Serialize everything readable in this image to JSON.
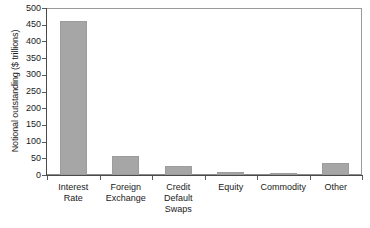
{
  "chart_data": {
    "type": "bar",
    "title": "",
    "subtitle": "",
    "xlabel": "",
    "ylabel": "Notional outstanding ($ trillions)",
    "categories": [
      "Interest Rate",
      "Foreign Exchange",
      "Credit Default Swaps",
      "Equity",
      "Commodity",
      "Other"
    ],
    "category_lines": [
      [
        "Interest",
        "Rate"
      ],
      [
        "Foreign",
        "Exchange"
      ],
      [
        "Credit",
        "Default",
        "Swaps"
      ],
      [
        "Equity"
      ],
      [
        "Commodity"
      ],
      [
        "Other"
      ]
    ],
    "values": [
      461,
      57,
      27,
      8,
      2,
      36
    ],
    "ylim": [
      0,
      500
    ],
    "y_ticks": [
      0,
      50,
      100,
      150,
      200,
      250,
      300,
      350,
      400,
      450,
      500
    ],
    "y_tick_labels": [
      "0",
      "50",
      "100",
      "150",
      "200",
      "250",
      "300",
      "350",
      "400",
      "450",
      "500"
    ],
    "grid": false,
    "legend": false,
    "legend_position": "none",
    "bar_color": "#a6a6a6",
    "bar_edge_color": "#9c9c9c",
    "axis_color": "#4a4a4a",
    "frame_color": "#8a8a8a",
    "text_color": "#1a1a1a",
    "background": "#ffffff"
  }
}
